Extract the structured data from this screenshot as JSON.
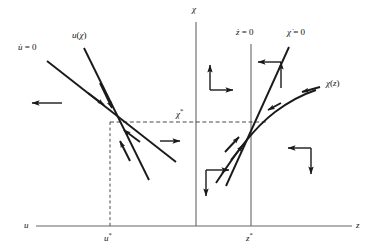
{
  "figure": {
    "type": "phase-diagram",
    "background": "#ffffff",
    "stroke_color": "#1a1a1a",
    "axis_color": "#555555",
    "width": 373,
    "height": 252
  },
  "axes": {
    "horizontal": {
      "label_left": "u",
      "label_right": "z",
      "y": 226,
      "x_start": 36,
      "x_end": 352
    },
    "vertical_chi": {
      "label": "χ",
      "x": 196,
      "y_top": 22,
      "y_bottom": 226
    }
  },
  "ticks": [
    {
      "name": "u-star",
      "label_html": "u*",
      "x": 110,
      "y": 238
    },
    {
      "name": "z-star",
      "label_html": "z*",
      "x": 251,
      "y": 238
    },
    {
      "name": "chi-star",
      "label_html": "χ*",
      "x": 180,
      "y": 113
    }
  ],
  "nullclines": [
    {
      "name": "u-dot-zero",
      "label": "Ḗ = 0",
      "label_text": "u̇ = 0",
      "x": 22,
      "y": 48
    },
    {
      "name": "u-of-chi",
      "label_text": "u(χ)",
      "x": 76,
      "y": 36
    },
    {
      "name": "z-dot-zero",
      "label_text": "ż = 0",
      "x": 238,
      "y": 33
    },
    {
      "name": "chi-dot-zero",
      "label_text": "χ̇ = 0",
      "x": 292,
      "y": 33
    },
    {
      "name": "chi-of-z",
      "label_text": "χ(z)",
      "x": 330,
      "y": 84
    }
  ],
  "vertical_lines": [
    {
      "name": "z-dot-zero-line",
      "x": 251,
      "y_top": 44,
      "y_bottom": 226
    }
  ],
  "dashed_guides": [
    {
      "name": "chi-star-horizontal",
      "orientation": "horizontal",
      "y": 122,
      "x_start": 110,
      "x_end": 266
    },
    {
      "name": "u-star-vertical",
      "orientation": "vertical",
      "x": 110,
      "y_start": 122,
      "y_end": 226
    }
  ],
  "equilibria": [
    {
      "name": "left-equilibrium",
      "x": 110,
      "y": 122
    },
    {
      "name": "right-equilibrium",
      "x": 251,
      "y": 122
    }
  ],
  "flow_arrows": [
    {
      "name": "arrow-left-region",
      "dir": "left",
      "x": 62,
      "y": 103,
      "len": 30
    },
    {
      "name": "arrow-mid-left-region",
      "dir": "right",
      "x": 160,
      "y": 141,
      "len": 22
    },
    {
      "name": "arrow-upper-mid-up",
      "dir": "up",
      "x": 210,
      "y": 90,
      "len": 25
    },
    {
      "name": "arrow-upper-mid-right",
      "dir": "right",
      "x": 210,
      "y": 90,
      "len": 24
    },
    {
      "name": "arrow-upper-right-up",
      "dir": "up",
      "x": 281,
      "y": 88,
      "len": 25
    },
    {
      "name": "arrow-upper-right-left",
      "dir": "left",
      "x": 281,
      "y": 62,
      "len": 24
    },
    {
      "name": "arrow-lower-mid-right",
      "dir": "right",
      "x": 206,
      "y": 170,
      "len": 24
    },
    {
      "name": "arrow-lower-mid-down",
      "dir": "down",
      "x": 206,
      "y": 170,
      "len": 25
    },
    {
      "name": "arrow-lower-right-left",
      "dir": "left",
      "x": 311,
      "y": 148,
      "len": 24
    },
    {
      "name": "arrow-lower-right-down",
      "dir": "down",
      "x": 311,
      "y": 148,
      "len": 25
    }
  ]
}
